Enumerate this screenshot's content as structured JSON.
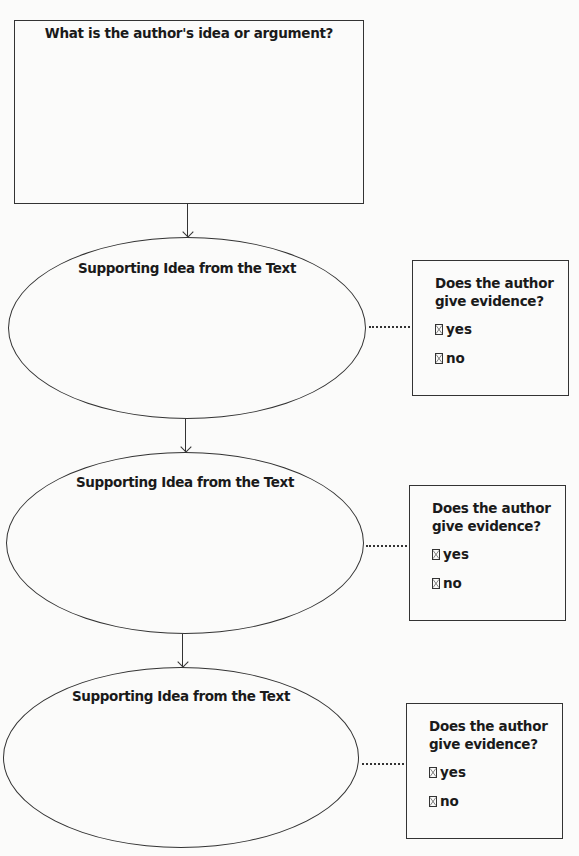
{
  "main": {
    "title": "What is the author's idea or argument?"
  },
  "supporting": [
    {
      "label": "Supporting Idea from the Text",
      "evidence": {
        "question": "Does the author give evidence?",
        "options": [
          "yes",
          "no"
        ]
      }
    },
    {
      "label": "Supporting Idea from the Text",
      "evidence": {
        "question": "Does the author give evidence?",
        "options": [
          "yes",
          "no"
        ]
      }
    },
    {
      "label": "Supporting Idea from the Text",
      "evidence": {
        "question": "Does the author give evidence?",
        "options": [
          "yes",
          "no"
        ]
      }
    }
  ],
  "colors": {
    "line": "#333333",
    "text": "#1a1a1a",
    "paper": "#fbfbfa"
  }
}
